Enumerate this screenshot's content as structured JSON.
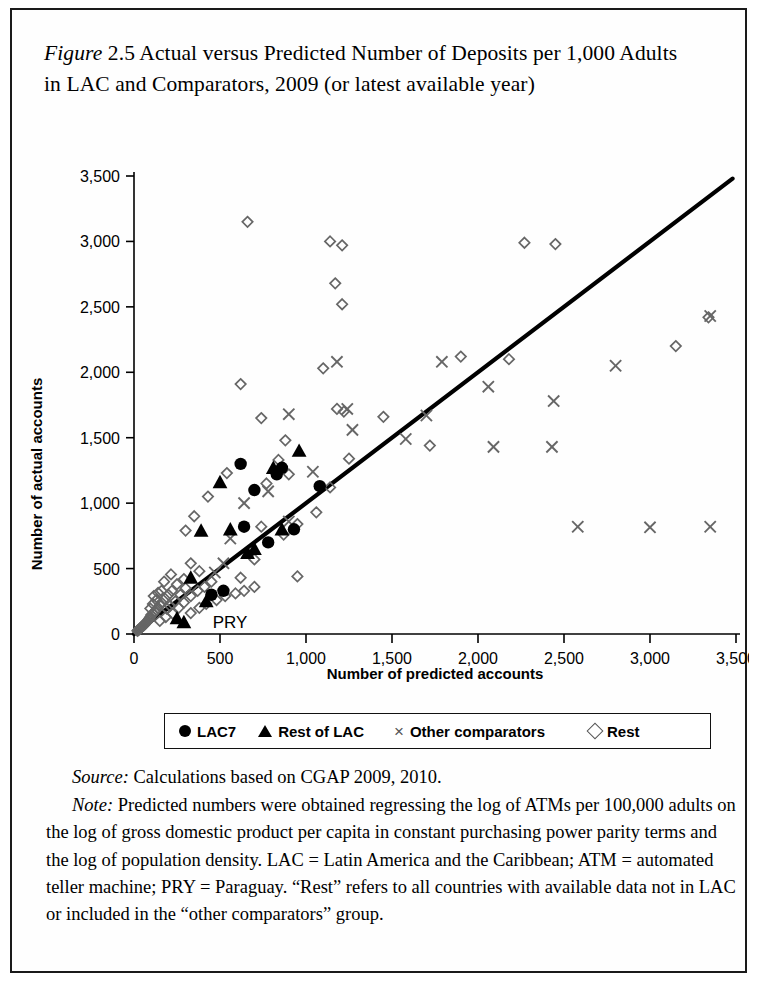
{
  "figure": {
    "label": "Figure",
    "number": "2.5",
    "title": " Actual versus Predicted Number of Deposits per 1,000 Adults in LAC and Comparators, 2009 (or latest available year)"
  },
  "source": {
    "lead": "Source:",
    "text": " Calculations based on CGAP 2009, 2010."
  },
  "note": {
    "lead": "Note:",
    "text": " Predicted numbers were obtained regressing the log of ATMs per 100,000 adults on the log of gross domestic product per capita in constant purchasing power parity terms and the log of population density. LAC = Latin America and the Caribbean; ATM = automated teller machine; PRY = Paraguay. “Rest” refers to all countries with available data not in LAC or included in the “other comparators” group."
  },
  "legend": {
    "items": [
      {
        "marker": "circle",
        "label": "LAC7"
      },
      {
        "marker": "triangle",
        "label": "Rest of LAC"
      },
      {
        "marker": "cross",
        "label": "Other comparators"
      },
      {
        "marker": "diamond",
        "label": "Rest"
      }
    ]
  },
  "annotations": [
    {
      "text": "PRY",
      "x": 330,
      "y": 95
    }
  ],
  "chart_data": {
    "type": "scatter",
    "title": "",
    "xlabel": "Number of predicted accounts",
    "ylabel": "Number of actual accounts",
    "xlim": [
      0,
      3500
    ],
    "ylim": [
      0,
      3500
    ],
    "xticks": [
      0,
      500,
      1000,
      1500,
      2000,
      2500,
      3000,
      3500
    ],
    "yticks": [
      0,
      500,
      1000,
      1500,
      2000,
      2500,
      3000,
      3500
    ],
    "xticklabels": [
      "0",
      "500",
      "1,000",
      "1,500",
      "2,000",
      "2,500",
      "3,000",
      "3,500"
    ],
    "yticklabels": [
      "0",
      "500",
      "1,000",
      "1,500",
      "2,000",
      "2,500",
      "3,000",
      "3,500"
    ],
    "grid": false,
    "legend_position": "below",
    "reference_line": {
      "name": "45-degree identity line",
      "x": [
        0,
        3480
      ],
      "y": [
        0,
        3480
      ]
    },
    "series": [
      {
        "name": "LAC7",
        "marker": "filled-circle",
        "color": "#000000",
        "points": [
          [
            620,
            1300
          ],
          [
            700,
            1100
          ],
          [
            640,
            820
          ],
          [
            830,
            1220
          ],
          [
            860,
            1270
          ],
          [
            1080,
            1130
          ],
          [
            450,
            300
          ],
          [
            520,
            330
          ],
          [
            780,
            700
          ],
          [
            930,
            800
          ]
        ]
      },
      {
        "name": "Rest of LAC",
        "marker": "filled-triangle",
        "color": "#000000",
        "points": [
          [
            500,
            1160
          ],
          [
            390,
            790
          ],
          [
            560,
            800
          ],
          [
            660,
            620
          ],
          [
            700,
            650
          ],
          [
            810,
            1270
          ],
          [
            860,
            800
          ],
          [
            960,
            1400
          ],
          [
            330,
            430
          ],
          [
            290,
            90
          ],
          [
            420,
            250
          ],
          [
            250,
            120
          ]
        ]
      },
      {
        "name": "Other comparators",
        "marker": "cross",
        "color": "#666666",
        "points": [
          [
            1180,
            2080
          ],
          [
            1240,
            1720
          ],
          [
            1270,
            1560
          ],
          [
            1580,
            1490
          ],
          [
            1700,
            1670
          ],
          [
            1790,
            2080
          ],
          [
            2060,
            1890
          ],
          [
            2090,
            1430
          ],
          [
            2440,
            1780
          ],
          [
            2430,
            1430
          ],
          [
            2800,
            2050
          ],
          [
            3350,
            2430
          ],
          [
            2580,
            820
          ],
          [
            3000,
            815
          ],
          [
            3350,
            820
          ],
          [
            900,
            1680
          ],
          [
            640,
            1000
          ],
          [
            560,
            730
          ],
          [
            520,
            540
          ],
          [
            470,
            470
          ],
          [
            1040,
            1240
          ],
          [
            780,
            1090
          ],
          [
            900,
            860
          ]
        ]
      },
      {
        "name": "Rest",
        "marker": "open-diamond",
        "color": "#666666",
        "points": [
          [
            660,
            3150
          ],
          [
            1140,
            3000
          ],
          [
            1210,
            2970
          ],
          [
            1170,
            2680
          ],
          [
            1210,
            2520
          ],
          [
            1100,
            2030
          ],
          [
            620,
            1910
          ],
          [
            1220,
            1700
          ],
          [
            1180,
            1720
          ],
          [
            740,
            1650
          ],
          [
            880,
            1480
          ],
          [
            840,
            1330
          ],
          [
            900,
            1220
          ],
          [
            540,
            1230
          ],
          [
            770,
            1150
          ],
          [
            430,
            1050
          ],
          [
            350,
            900
          ],
          [
            300,
            790
          ],
          [
            1140,
            1120
          ],
          [
            1060,
            930
          ],
          [
            950,
            840
          ],
          [
            870,
            760
          ],
          [
            620,
            430
          ],
          [
            950,
            440
          ],
          [
            700,
            570
          ],
          [
            740,
            820
          ],
          [
            1250,
            1340
          ],
          [
            1450,
            1660
          ],
          [
            1900,
            2120
          ],
          [
            2270,
            2990
          ],
          [
            2450,
            2980
          ],
          [
            3150,
            2200
          ],
          [
            3340,
            2420
          ],
          [
            2180,
            2100
          ],
          [
            1720,
            1440
          ],
          [
            330,
            540
          ],
          [
            380,
            480
          ],
          [
            290,
            420
          ],
          [
            250,
            380
          ],
          [
            220,
            330
          ],
          [
            200,
            300
          ],
          [
            180,
            270
          ],
          [
            160,
            240
          ],
          [
            150,
            220
          ],
          [
            140,
            200
          ],
          [
            130,
            185
          ],
          [
            120,
            170
          ],
          [
            110,
            155
          ],
          [
            100,
            145
          ],
          [
            95,
            130
          ],
          [
            90,
            120
          ],
          [
            85,
            110
          ],
          [
            80,
            100
          ],
          [
            75,
            95
          ],
          [
            70,
            85
          ],
          [
            65,
            80
          ],
          [
            60,
            70
          ],
          [
            55,
            65
          ],
          [
            50,
            60
          ],
          [
            45,
            55
          ],
          [
            40,
            48
          ],
          [
            35,
            42
          ],
          [
            30,
            35
          ],
          [
            25,
            30
          ],
          [
            20,
            25
          ],
          [
            240,
            250
          ],
          [
            270,
            300
          ],
          [
            300,
            350
          ],
          [
            190,
            195
          ],
          [
            210,
            215
          ],
          [
            160,
            330
          ],
          [
            175,
            400
          ],
          [
            215,
            455
          ],
          [
            260,
            200
          ],
          [
            290,
            240
          ],
          [
            330,
            290
          ],
          [
            370,
            330
          ],
          [
            410,
            360
          ],
          [
            450,
            400
          ],
          [
            330,
            160
          ],
          [
            380,
            200
          ],
          [
            420,
            230
          ],
          [
            480,
            260
          ],
          [
            530,
            290
          ],
          [
            590,
            310
          ],
          [
            640,
            330
          ],
          [
            700,
            360
          ],
          [
            150,
            100
          ],
          [
            185,
            130
          ],
          [
            225,
            155
          ],
          [
            95,
            195
          ],
          [
            110,
            230
          ],
          [
            130,
            260
          ],
          [
            115,
            290
          ],
          [
            140,
            315
          ]
        ]
      }
    ]
  }
}
